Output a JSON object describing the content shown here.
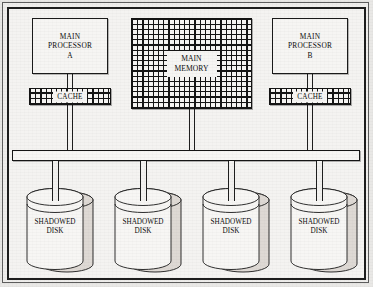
{
  "diagram": {
    "background_color": "#f4f3f1",
    "line_color": "#1a1a1a",
    "processors": [
      {
        "id": "a",
        "label": "MAIN\nPROCESSOR\nA",
        "cache_label": "CACHE"
      },
      {
        "id": "b",
        "label": "MAIN\nPROCESSOR\nB",
        "cache_label": "CACHE"
      }
    ],
    "memory": {
      "label": "MAIN\nMEMORY",
      "fill": "crosshatch"
    },
    "bus": {
      "label": "system-bus"
    },
    "disks": [
      {
        "label": "SHADOWED\nDISK"
      },
      {
        "label": "SHADOWED\nDISK"
      },
      {
        "label": "SHADOWED\nDISK"
      },
      {
        "label": "SHADOWED\nDISK"
      }
    ]
  }
}
